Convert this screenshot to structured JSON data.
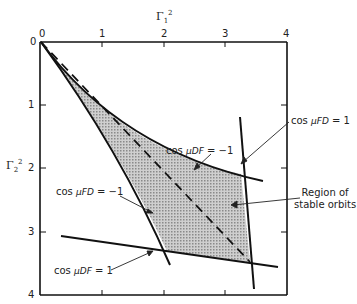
{
  "diagram": {
    "type": "stability-region-plot",
    "x_axis": {
      "title_base": "Γ",
      "title_sub": "1",
      "title_sup": "2",
      "ticks": [
        "0",
        "1",
        "2",
        "3",
        "4"
      ],
      "range": [
        0,
        4
      ],
      "position": "top"
    },
    "y_axis": {
      "title_base": "Γ",
      "title_sub": "2",
      "title_sup": "2",
      "ticks": [
        "0",
        "1",
        "2",
        "3",
        "4"
      ],
      "range": [
        0,
        4
      ],
      "inverted": true
    },
    "curves": [
      {
        "id": "cos-mudf-minus1",
        "cos": "cos",
        "mu": "μDF",
        "eq": "= −1"
      },
      {
        "id": "cos-mufd-plus1",
        "cos": "cos",
        "mu": "μFD",
        "eq": "= 1"
      },
      {
        "id": "cos-mufd-minus1",
        "cos": "cos",
        "mu": "μFD",
        "eq": "= −1"
      },
      {
        "id": "cos-mudf-plus1",
        "cos": "cos",
        "mu": "μDF",
        "eq": "= 1"
      }
    ],
    "region_label": [
      "Region of",
      "stable orbits"
    ],
    "colors": {
      "line": "#111111",
      "fill": "#b8b8b8",
      "background": "#ffffff"
    }
  }
}
